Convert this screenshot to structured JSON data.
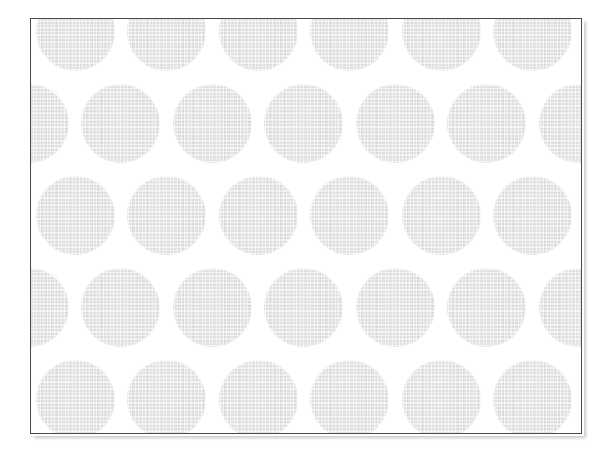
{
  "image": {
    "title": "Polka dot halftone pattern swatch",
    "width": 612,
    "height": 458,
    "background_color": "#ffffff"
  },
  "swatch": {
    "name": "dot-pattern-swatch",
    "frame": {
      "x": 30,
      "y": 18,
      "width": 552,
      "height": 416
    },
    "border_color": "#4a4a4a",
    "border_width": 1,
    "fill_color": "#ffffff",
    "shadow_color": "#c9c9c9"
  },
  "pattern": {
    "type": "staggered-circle-grid",
    "dot_color": "#dfdfdf",
    "dot_texture": "halftone-weave",
    "dot_diameter": 79,
    "column_spacing": 91.5,
    "row_spacing": 92,
    "row_offset_x": 45.75,
    "first_row_center_y": 13,
    "first_column_center_x": 75,
    "rows": 6,
    "columns": 8
  }
}
